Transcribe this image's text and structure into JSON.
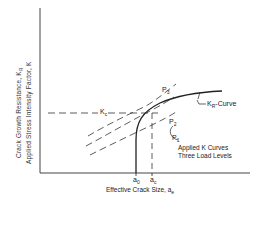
{
  "diagram": {
    "type": "R-curve fracture mechanics diagram",
    "y_axis_label_line1": "Crack Growth Resistance, K",
    "y_axis_label_line1_sub": "R",
    "y_axis_label_line2": "Applied Stress Intensity Factor, K",
    "x_axis_label": "Effective Crack Size, a",
    "x_axis_label_sub": "e",
    "kc_label": "K",
    "kc_label_sub": "c",
    "kr_curve_label": "K",
    "kr_curve_label_sub": "R",
    "kr_curve_label_suffix": "-Curve",
    "load_labels": [
      {
        "text": "P",
        "sub": "3"
      },
      {
        "text": "P",
        "sub": "2"
      },
      {
        "text": "P",
        "sub": "1"
      }
    ],
    "applied_curves_label_line1": "Applied K Curves",
    "applied_curves_label_line2": "Three Load Levels",
    "x_tick_a0": "a",
    "x_tick_a0_sub": "0",
    "x_tick_ac": "a",
    "x_tick_ac_sub": "c",
    "line_color": "#222222"
  }
}
